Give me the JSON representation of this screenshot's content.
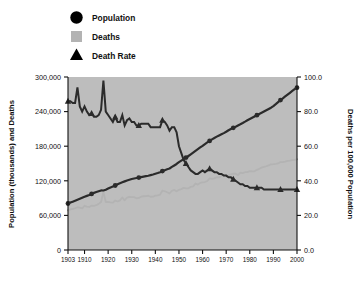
{
  "legend": {
    "position": "top-left",
    "items": [
      {
        "label": "Population",
        "marker": "circle",
        "color": "#2b2b2b",
        "icon": "circle-marker-icon"
      },
      {
        "label": "Deaths",
        "marker": "square",
        "color": "#b3b3b3",
        "icon": "square-marker-icon"
      },
      {
        "label": "Death Rate",
        "marker": "triangle",
        "color": "#2b2b2b",
        "icon": "triangle-marker-icon"
      }
    ]
  },
  "chart_data": {
    "type": "line",
    "title": "",
    "xlabel": "",
    "ylabel": "Population (thousands) and Deaths",
    "y2label": "Deaths per 100,000 Population",
    "grid": false,
    "plot_background": "#bdbdbd",
    "xlim": [
      1903,
      2000
    ],
    "xticks": [
      1903,
      1910,
      1920,
      1930,
      1940,
      1950,
      1960,
      1970,
      1980,
      1990,
      2000
    ],
    "xticklabels": [
      "1903",
      "1910",
      "1920",
      "1930",
      "1940",
      "1950",
      "1960",
      "1970",
      "1980",
      "1990",
      "2000"
    ],
    "ylim": [
      0,
      300000
    ],
    "yticks": [
      0,
      60000,
      120000,
      180000,
      240000,
      300000
    ],
    "yticklabels": [
      "0",
      "60,000",
      "120,000",
      "180,000",
      "240,000",
      "300,000"
    ],
    "y2lim": [
      0.0,
      100.0
    ],
    "y2ticks": [
      0.0,
      20.0,
      40.0,
      60.0,
      80.0,
      100.0
    ],
    "y2ticklabels": [
      "0.0",
      "20.0",
      "40.0",
      "60.0",
      "80.0",
      "100.0"
    ],
    "x": [
      1903,
      1904,
      1905,
      1906,
      1907,
      1908,
      1909,
      1910,
      1911,
      1912,
      1913,
      1914,
      1915,
      1916,
      1917,
      1918,
      1919,
      1920,
      1921,
      1922,
      1923,
      1924,
      1925,
      1926,
      1927,
      1928,
      1929,
      1930,
      1931,
      1932,
      1933,
      1934,
      1935,
      1936,
      1937,
      1938,
      1939,
      1940,
      1941,
      1942,
      1943,
      1944,
      1945,
      1946,
      1947,
      1948,
      1949,
      1950,
      1951,
      1952,
      1953,
      1954,
      1955,
      1956,
      1957,
      1958,
      1959,
      1960,
      1961,
      1962,
      1963,
      1964,
      1965,
      1966,
      1967,
      1968,
      1969,
      1970,
      1971,
      1972,
      1973,
      1974,
      1975,
      1976,
      1977,
      1978,
      1979,
      1980,
      1981,
      1982,
      1983,
      1984,
      1985,
      1986,
      1987,
      1988,
      1989,
      1990,
      1991,
      1992,
      1993,
      1994,
      1995,
      1996,
      1997,
      1998,
      1999,
      2000
    ],
    "series": [
      {
        "name": "Population",
        "axis": "left",
        "marker": "circle",
        "color": "#2b2b2b",
        "units": "thousands",
        "values": [
          80600,
          82200,
          83800,
          85400,
          87000,
          88700,
          90500,
          92400,
          93900,
          95300,
          97200,
          99100,
          100500,
          101900,
          103300,
          103200,
          104500,
          106500,
          108500,
          110100,
          111900,
          114100,
          115800,
          117400,
          119000,
          120500,
          121800,
          123100,
          124000,
          124800,
          125600,
          126400,
          127250,
          128050,
          128800,
          129800,
          130880,
          132120,
          133400,
          134860,
          136740,
          138400,
          139900,
          141400,
          144100,
          146600,
          149200,
          152270,
          154880,
          157550,
          160180,
          163030,
          165930,
          168900,
          171980,
          174880,
          177830,
          180670,
          183690,
          186540,
          189240,
          191890,
          194300,
          196560,
          198710,
          200710,
          202680,
          205050,
          207660,
          209900,
          211900,
          213850,
          215970,
          218040,
          220240,
          222580,
          225060,
          227220,
          229470,
          231660,
          233790,
          235820,
          237920,
          240130,
          242290,
          244500,
          246820,
          249620,
          252980,
          256510,
          259920,
          263130,
          266280,
          269390,
          272650,
          275850,
          279040,
          281420
        ]
      },
      {
        "name": "Deaths",
        "axis": "left",
        "marker": "square",
        "color": "#b3b3b3",
        "units": "count",
        "values": [
          69000,
          70500,
          71200,
          72400,
          74100,
          73500,
          72300,
          76700,
          75400,
          74600,
          77100,
          76600,
          77700,
          80000,
          83300,
          100800,
          83200,
          83300,
          82500,
          82000,
          85800,
          84100,
          86000,
          91000,
          86000,
          91000,
          92300,
          91600,
          91700,
          89700,
          90300,
          92400,
          93200,
          93400,
          94100,
          92300,
          92400,
          94300,
          94700,
          96000,
          103100,
          101900,
          100100,
          97900,
          102700,
          104100,
          101700,
          104300,
          105500,
          107800,
          107000,
          107000,
          109500,
          110300,
          115250,
          113410,
          116440,
          117150,
          117880,
          119670,
          124170,
          123480,
          124250,
          126230,
          125960,
          128390,
          128740,
          129340,
          129720,
          131300,
          132330,
          132210,
          129800,
          134120,
          133240,
          134870,
          135050,
          136890,
          136270,
          136410,
          138970,
          140800,
          142880,
          144010,
          145230,
          146770,
          148620,
          148830,
          149290,
          150120,
          152440,
          152330,
          153140,
          154490,
          155030,
          155760,
          156140,
          157300
        ]
      },
      {
        "name": "Death Rate",
        "axis": "right",
        "marker": "triangle",
        "color": "#2b2b2b",
        "units": "per 100,000 population",
        "values": [
          85.6,
          85.8,
          85.0,
          84.8,
          94.0,
          82.9,
          79.9,
          83.0,
          80.3,
          78.3,
          79.3,
          77.3,
          77.3,
          78.5,
          80.6,
          97.7,
          79.6,
          78.2,
          76.0,
          74.5,
          76.7,
          73.7,
          74.3,
          77.5,
          72.3,
          75.5,
          75.8,
          74.4,
          74.0,
          71.9,
          71.9,
          73.1,
          73.3,
          72.9,
          73.1,
          71.1,
          70.6,
          71.4,
          71.0,
          71.2,
          75.4,
          73.6,
          71.6,
          69.2,
          71.3,
          71.0,
          68.2,
          68.5,
          68.1,
          68.4,
          66.8,
          65.6,
          66.0,
          65.3,
          67.0,
          64.8,
          65.5,
          64.8,
          64.2,
          64.1,
          65.6,
          64.4,
          63.9,
          64.2,
          63.4,
          63.9,
          63.5,
          63.1,
          62.5,
          62.6,
          62.5,
          61.8,
          60.1,
          61.5,
          60.5,
          60.6,
          60.0,
          60.2,
          59.4,
          58.9,
          59.4,
          59.7,
          60.1,
          59.9,
          59.9,
          60.0,
          60.2,
          59.6,
          59.0,
          58.5,
          58.7,
          57.9,
          57.5,
          57.3,
          56.9,
          56.5,
          56.0,
          55.9
        ]
      }
    ],
    "death_rate_display": [
      86,
      86,
      85,
      85,
      94,
      83,
      80,
      83,
      80,
      78,
      79,
      77,
      77,
      78,
      81,
      98,
      80,
      78,
      76,
      74,
      77,
      74,
      74,
      78,
      72,
      75,
      76,
      74,
      74,
      72,
      72,
      73,
      73,
      73,
      73,
      71,
      71,
      71,
      71,
      71,
      75,
      74,
      72,
      69,
      71,
      71,
      68,
      60,
      56,
      52,
      50,
      48,
      46,
      45,
      44,
      44,
      45,
      46,
      45,
      46,
      47,
      46,
      45,
      45,
      44,
      44,
      43,
      43,
      42,
      42,
      41,
      40,
      39,
      38,
      38,
      37,
      37,
      36,
      36,
      36,
      36,
      36,
      36,
      35,
      35,
      35,
      35,
      35,
      35,
      35,
      35,
      35,
      35,
      35,
      35,
      35,
      35,
      35
    ]
  }
}
